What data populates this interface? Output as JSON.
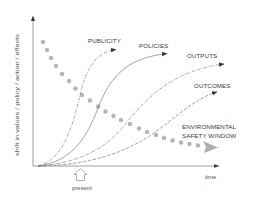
{
  "diagram": {
    "y_axis_label": "shift in values / policy / action / effects",
    "x_axis_label": "time",
    "present_marker_label": "present",
    "curves": [
      {
        "label": "PUBLICITY"
      },
      {
        "label": "POLICIES"
      },
      {
        "label": "OUTPUTS"
      },
      {
        "label": "OUTCOMES"
      }
    ],
    "safety_window": {
      "line1": "ENVIRONMENTAL",
      "line2": "SAFETY WINDOW"
    },
    "colors": {
      "axis": "#555555",
      "curve": "#666666",
      "dots": "#b0b0b0",
      "text": "#3a3a3a"
    }
  }
}
